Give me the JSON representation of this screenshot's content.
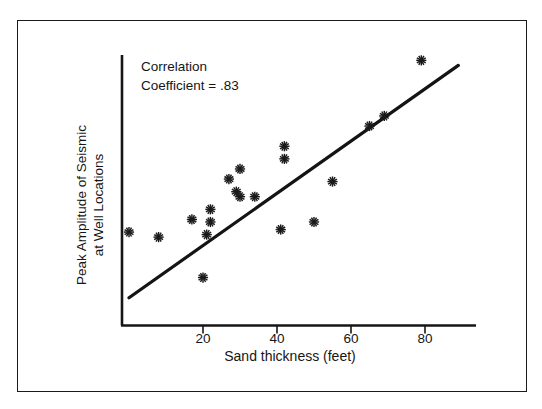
{
  "figure": {
    "background_color": "#ffffff",
    "frame_color": "#1a1a1a",
    "ink_color": "#161616"
  },
  "annotation": {
    "line1": "Correlation",
    "line2": "Coefficient = .83"
  },
  "axis": {
    "x_title": "Sand thickness (feet)",
    "y_title_line1": "Peak Amplitude of Seismic",
    "y_title_line2": "at Well Locations",
    "x_ticks": [
      "20",
      "40",
      "60",
      "80"
    ]
  },
  "chart_data": {
    "type": "scatter",
    "title": "",
    "subtitle": "",
    "xlabel": "Sand thickness (feet)",
    "ylabel": "Peak Amplitude of Seismic at Well Locations",
    "xlim": [
      0,
      93
    ],
    "ylim": [
      0,
      100
    ],
    "grid": false,
    "legend": "none",
    "xticks": [
      20,
      40,
      60,
      80
    ],
    "yticks": [],
    "ytick_labels_shown": false,
    "annotations": [
      {
        "text": "Correlation Coefficient = .83",
        "x": 6,
        "y": 93,
        "correlation_coefficient": 0.83
      }
    ],
    "marker": "asterisk",
    "marker_color": "#1a1a1a",
    "n_points": 20,
    "points": [
      {
        "x": 0,
        "y": 37
      },
      {
        "x": 8,
        "y": 35
      },
      {
        "x": 17,
        "y": 42
      },
      {
        "x": 20,
        "y": 19
      },
      {
        "x": 21,
        "y": 36
      },
      {
        "x": 22,
        "y": 41
      },
      {
        "x": 22,
        "y": 46
      },
      {
        "x": 27,
        "y": 58
      },
      {
        "x": 29,
        "y": 53
      },
      {
        "x": 30,
        "y": 62
      },
      {
        "x": 30,
        "y": 51
      },
      {
        "x": 34,
        "y": 51
      },
      {
        "x": 41,
        "y": 38
      },
      {
        "x": 42,
        "y": 71
      },
      {
        "x": 42,
        "y": 66
      },
      {
        "x": 50,
        "y": 41
      },
      {
        "x": 55,
        "y": 57
      },
      {
        "x": 65,
        "y": 79
      },
      {
        "x": 69,
        "y": 83
      },
      {
        "x": 79,
        "y": 105
      }
    ],
    "trendline": {
      "type": "linear-fit",
      "label": "regression line",
      "x_start": 0,
      "y_start": 11,
      "x_end": 89,
      "y_end": 103,
      "color": "#141414",
      "width_px": 3.2
    }
  }
}
